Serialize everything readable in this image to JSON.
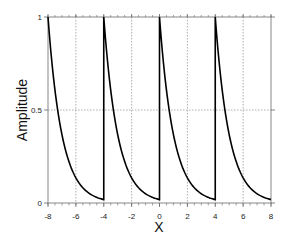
{
  "chart_data": {
    "type": "line",
    "title": "",
    "xlabel": "X",
    "ylabel": "Amplitude",
    "xlim": [
      -8,
      8
    ],
    "ylim": [
      0,
      1
    ],
    "xticks": [
      -8,
      -6,
      -4,
      -2,
      0,
      2,
      4,
      6,
      8
    ],
    "yticks": [
      0,
      0.5,
      1
    ],
    "xtick_labels": [
      "-8",
      "-6",
      "-4",
      "-2",
      "0",
      "2",
      "4",
      "6",
      "8"
    ],
    "ytick_labels": [
      "0",
      "0.5",
      "1"
    ],
    "grid": true,
    "legend": null,
    "series": [
      {
        "name": "periodic exponential decay",
        "function": "exp(-(x mod 4))",
        "period": 4,
        "color": "#000000",
        "segments": [
          {
            "x_start": -8,
            "x_end": -4,
            "y_start": 1,
            "y_end": 0.018
          },
          {
            "x_start": -4,
            "x_end": 0,
            "y_start": 1,
            "y_end": 0.018
          },
          {
            "x_start": 0,
            "x_end": 4,
            "y_start": 1,
            "y_end": 0.018
          },
          {
            "x_start": 4,
            "x_end": 8,
            "y_start": 1,
            "y_end": 0.018
          }
        ]
      }
    ]
  }
}
